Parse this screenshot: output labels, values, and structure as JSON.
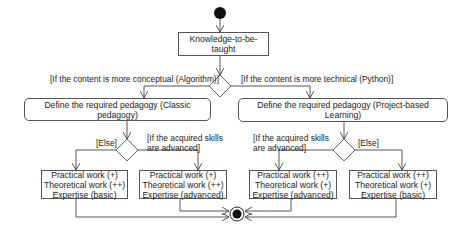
{
  "diagram": {
    "type": "uml-activity",
    "start_node": "initial-node",
    "end_node": "final-node",
    "knowledge_node": {
      "label": "Knowledge-to-be-taught"
    },
    "decision_main": {
      "guard_left": "[If the content is more conceptual (Algorithm)]",
      "guard_right": "[If the content is more technical (Python)]"
    },
    "action_left": {
      "label": "Define the required pedagogy (Classic pedagogy)"
    },
    "action_right": {
      "label": "Define the required pedagogy (Project-based Learning)"
    },
    "decision_left": {
      "guard_else": "[Else]",
      "guard_advanced_line1": "[If the acquired skills",
      "guard_advanced_line2": "are advanced]"
    },
    "decision_right": {
      "guard_advanced_line1": "[If the acquired skills",
      "guard_advanced_line2": "are advanced]",
      "guard_else": "[Else]"
    },
    "outcomes": [
      {
        "lines": [
          "Practical work (+)",
          "Theoretical work (++)",
          "Expertise (basic)"
        ]
      },
      {
        "lines": [
          "Practical work (+)",
          "Theoretical work (++)",
          "Expertise (advanced)"
        ]
      },
      {
        "lines": [
          "Practical work (++)",
          "Theoretical work (+)",
          "Expertise (advanced)"
        ]
      },
      {
        "lines": [
          "Practical work (++)",
          "Theoretical work (+)",
          "Expertise (basic)"
        ]
      }
    ]
  }
}
